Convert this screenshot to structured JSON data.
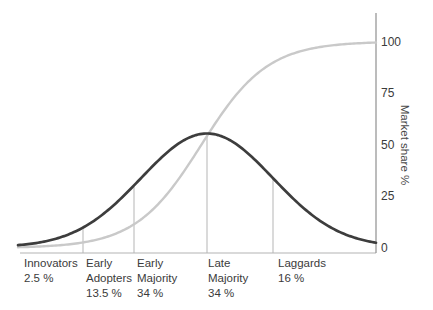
{
  "chart_data": {
    "type": "line",
    "categories": [
      {
        "label": "Innovators",
        "pct_label": "2.5 %",
        "value_pct": 2.5
      },
      {
        "label": "Early Adopters",
        "pct_label": "13.5 %",
        "value_pct": 13.5
      },
      {
        "label": "Early Majority",
        "pct_label": "34 %",
        "value_pct": 34
      },
      {
        "label": "Late Majority",
        "pct_label": "34 %",
        "value_pct": 34
      },
      {
        "label": "Laggards",
        "pct_label": "16 %",
        "value_pct": 16
      }
    ],
    "series": [
      {
        "name": "adopter-distribution-bell-curve",
        "color": "#3d3d3d"
      },
      {
        "name": "cumulative-market-share-s-curve",
        "color": "#c9c9c9"
      }
    ],
    "y_axis": {
      "label": "Market share %",
      "side": "right",
      "range": [
        0,
        100
      ],
      "ticks": [
        100,
        75,
        50,
        25,
        0
      ]
    }
  },
  "colors": {
    "axis": "#8f8f8f",
    "baseline": "#b4b4b4",
    "divider": "#b5b5b5",
    "text": "#3b3b3b"
  }
}
